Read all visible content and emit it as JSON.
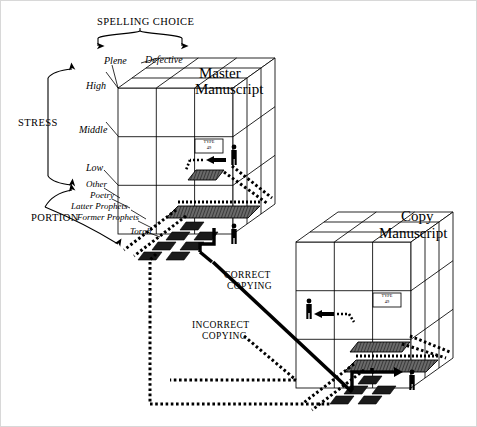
{
  "figure": {
    "background": "#ffffff",
    "ink": "#000000",
    "border_color": "#cfcfcf"
  },
  "axes": {
    "spelling": {
      "title": "SPELLING CHOICE",
      "categories": [
        "Plene",
        "Defective"
      ]
    },
    "stress": {
      "title": "STRESS",
      "categories": [
        "High",
        "Middle",
        "Low"
      ]
    },
    "portion": {
      "title": "PORTION",
      "categories": [
        "Other",
        "Poetry",
        "Latter Prophets",
        "Former Prophets",
        "Torah"
      ]
    }
  },
  "cubes": [
    {
      "id": "master",
      "title_line1": "Master",
      "title_line2": "Manuscript",
      "cell_label_line1": "TYPE",
      "cell_label_line2": "49"
    },
    {
      "id": "copy",
      "title_line1": "Copy",
      "title_line2": "Manuscript",
      "cell_label_line1": "TYPE",
      "cell_label_line2": "49"
    }
  ],
  "flows": [
    {
      "id": "correct",
      "line1": "CORRECT",
      "line2": "COPYING",
      "style": "solid"
    },
    {
      "id": "incorrect",
      "line1": "INCORRECT",
      "line2": "COPYING",
      "style": "dotted"
    }
  ]
}
